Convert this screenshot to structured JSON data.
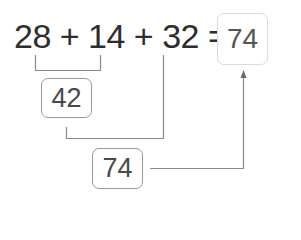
{
  "equation": {
    "text": "28 + 14 + 32 =",
    "terms": [
      "28",
      "14",
      "32"
    ],
    "operator": "+",
    "equals": "="
  },
  "answer_box": {
    "value": "74"
  },
  "partial_sum_box": {
    "value": "42",
    "from_terms": [
      "28",
      "14"
    ]
  },
  "total_box": {
    "value": "74",
    "from": [
      "42",
      "32"
    ]
  },
  "colors": {
    "text": "#2e2e2e",
    "line": "#8a8a8a",
    "box_border": "#9a9a9a",
    "answer_border": "#dcdcdc"
  }
}
